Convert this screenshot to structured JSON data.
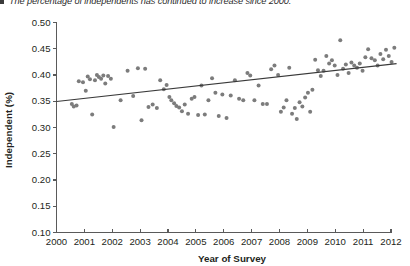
{
  "caption": {
    "bullet": "square-bullet",
    "text": "The percentage of independents has continued to increase since 2000."
  },
  "chart_data": {
    "type": "scatter",
    "title": "",
    "xlabel": "Year of Survey",
    "ylabel": "Independent (%)",
    "xlim": [
      2000,
      2012
    ],
    "ylim": [
      0.1,
      0.5
    ],
    "grid": false,
    "legend": null,
    "xticks": [
      2000,
      2001,
      2002,
      2003,
      2004,
      2005,
      2006,
      2007,
      2008,
      2009,
      2010,
      2011,
      2012
    ],
    "xtick_labels": [
      "2000",
      "2001",
      "2002",
      "2003",
      "2004",
      "2005",
      "2006",
      "2007",
      "2008",
      "2009",
      "2010",
      "2011",
      "2012"
    ],
    "yticks": [
      0.1,
      0.15,
      0.2,
      0.25,
      0.3,
      0.35,
      0.4,
      0.45,
      0.5
    ],
    "ytick_labels": [
      "0.10",
      "0.15",
      "0.20",
      "0.25",
      "0.30",
      "0.35",
      "0.40",
      "0.45",
      "0.50"
    ],
    "marker_color": "#7c7c7c",
    "marker_size": 2.0,
    "trendline": {
      "label": "linear-fit",
      "color": "#3a3a3a",
      "x": [
        2000.0,
        2012.2
      ],
      "y": [
        0.3495,
        0.4215
      ]
    },
    "points": [
      {
        "x": 2000.55,
        "y": 0.345
      },
      {
        "x": 2000.62,
        "y": 0.34
      },
      {
        "x": 2000.72,
        "y": 0.342
      },
      {
        "x": 2000.8,
        "y": 0.388
      },
      {
        "x": 2000.95,
        "y": 0.386
      },
      {
        "x": 2001.05,
        "y": 0.37
      },
      {
        "x": 2001.12,
        "y": 0.397
      },
      {
        "x": 2001.2,
        "y": 0.392
      },
      {
        "x": 2001.28,
        "y": 0.325
      },
      {
        "x": 2001.38,
        "y": 0.39
      },
      {
        "x": 2001.45,
        "y": 0.4
      },
      {
        "x": 2001.52,
        "y": 0.396
      },
      {
        "x": 2001.6,
        "y": 0.393
      },
      {
        "x": 2001.68,
        "y": 0.399
      },
      {
        "x": 2001.75,
        "y": 0.384
      },
      {
        "x": 2001.85,
        "y": 0.398
      },
      {
        "x": 2001.95,
        "y": 0.393
      },
      {
        "x": 2002.05,
        "y": 0.301
      },
      {
        "x": 2002.3,
        "y": 0.352
      },
      {
        "x": 2002.55,
        "y": 0.408
      },
      {
        "x": 2002.75,
        "y": 0.36
      },
      {
        "x": 2002.92,
        "y": 0.413
      },
      {
        "x": 2003.05,
        "y": 0.314
      },
      {
        "x": 2003.18,
        "y": 0.412
      },
      {
        "x": 2003.3,
        "y": 0.339
      },
      {
        "x": 2003.45,
        "y": 0.344
      },
      {
        "x": 2003.6,
        "y": 0.337
      },
      {
        "x": 2003.72,
        "y": 0.39
      },
      {
        "x": 2003.85,
        "y": 0.373
      },
      {
        "x": 2003.95,
        "y": 0.381
      },
      {
        "x": 2004.05,
        "y": 0.358
      },
      {
        "x": 2004.12,
        "y": 0.352
      },
      {
        "x": 2004.22,
        "y": 0.346
      },
      {
        "x": 2004.3,
        "y": 0.341
      },
      {
        "x": 2004.4,
        "y": 0.338
      },
      {
        "x": 2004.5,
        "y": 0.331
      },
      {
        "x": 2004.6,
        "y": 0.344
      },
      {
        "x": 2004.72,
        "y": 0.326
      },
      {
        "x": 2004.85,
        "y": 0.355
      },
      {
        "x": 2004.95,
        "y": 0.358
      },
      {
        "x": 2005.08,
        "y": 0.324
      },
      {
        "x": 2005.2,
        "y": 0.38
      },
      {
        "x": 2005.32,
        "y": 0.325
      },
      {
        "x": 2005.45,
        "y": 0.352
      },
      {
        "x": 2005.58,
        "y": 0.394
      },
      {
        "x": 2005.7,
        "y": 0.366
      },
      {
        "x": 2005.82,
        "y": 0.322
      },
      {
        "x": 2005.95,
        "y": 0.363
      },
      {
        "x": 2006.1,
        "y": 0.318
      },
      {
        "x": 2006.25,
        "y": 0.361
      },
      {
        "x": 2006.4,
        "y": 0.39
      },
      {
        "x": 2006.55,
        "y": 0.355
      },
      {
        "x": 2006.7,
        "y": 0.352
      },
      {
        "x": 2006.85,
        "y": 0.404
      },
      {
        "x": 2006.95,
        "y": 0.399
      },
      {
        "x": 2007.1,
        "y": 0.352
      },
      {
        "x": 2007.25,
        "y": 0.38
      },
      {
        "x": 2007.4,
        "y": 0.345
      },
      {
        "x": 2007.55,
        "y": 0.345
      },
      {
        "x": 2007.7,
        "y": 0.411
      },
      {
        "x": 2007.82,
        "y": 0.418
      },
      {
        "x": 2007.95,
        "y": 0.4
      },
      {
        "x": 2008.05,
        "y": 0.33
      },
      {
        "x": 2008.15,
        "y": 0.338
      },
      {
        "x": 2008.25,
        "y": 0.352
      },
      {
        "x": 2008.35,
        "y": 0.414
      },
      {
        "x": 2008.45,
        "y": 0.326
      },
      {
        "x": 2008.55,
        "y": 0.337
      },
      {
        "x": 2008.62,
        "y": 0.316
      },
      {
        "x": 2008.72,
        "y": 0.348
      },
      {
        "x": 2008.82,
        "y": 0.34
      },
      {
        "x": 2008.92,
        "y": 0.357
      },
      {
        "x": 2009.02,
        "y": 0.366
      },
      {
        "x": 2009.1,
        "y": 0.33
      },
      {
        "x": 2009.18,
        "y": 0.372
      },
      {
        "x": 2009.28,
        "y": 0.429
      },
      {
        "x": 2009.38,
        "y": 0.409
      },
      {
        "x": 2009.48,
        "y": 0.398
      },
      {
        "x": 2009.58,
        "y": 0.408
      },
      {
        "x": 2009.68,
        "y": 0.436
      },
      {
        "x": 2009.78,
        "y": 0.422
      },
      {
        "x": 2009.88,
        "y": 0.428
      },
      {
        "x": 2009.98,
        "y": 0.418
      },
      {
        "x": 2010.08,
        "y": 0.4
      },
      {
        "x": 2010.18,
        "y": 0.466
      },
      {
        "x": 2010.28,
        "y": 0.412
      },
      {
        "x": 2010.38,
        "y": 0.42
      },
      {
        "x": 2010.48,
        "y": 0.404
      },
      {
        "x": 2010.58,
        "y": 0.424
      },
      {
        "x": 2010.68,
        "y": 0.418
      },
      {
        "x": 2010.78,
        "y": 0.414
      },
      {
        "x": 2010.88,
        "y": 0.422
      },
      {
        "x": 2010.98,
        "y": 0.408
      },
      {
        "x": 2011.08,
        "y": 0.434
      },
      {
        "x": 2011.18,
        "y": 0.449
      },
      {
        "x": 2011.3,
        "y": 0.432
      },
      {
        "x": 2011.42,
        "y": 0.428
      },
      {
        "x": 2011.52,
        "y": 0.418
      },
      {
        "x": 2011.62,
        "y": 0.44
      },
      {
        "x": 2011.72,
        "y": 0.43
      },
      {
        "x": 2011.82,
        "y": 0.448
      },
      {
        "x": 2011.92,
        "y": 0.436
      },
      {
        "x": 2012.02,
        "y": 0.425
      },
      {
        "x": 2012.12,
        "y": 0.452
      }
    ]
  }
}
